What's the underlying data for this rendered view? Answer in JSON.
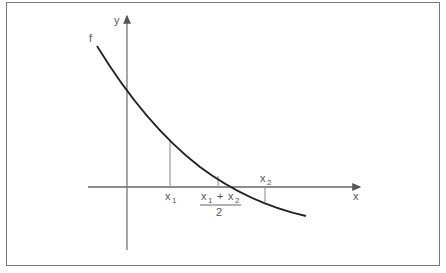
{
  "diagram": {
    "function_label": "f",
    "y_axis_label": "y",
    "x_axis_label": "x",
    "markers": [
      {
        "label": "x",
        "subscript": "1"
      },
      {
        "label": "x",
        "subscript": "2"
      }
    ],
    "midpoint": {
      "numerator_left": "x",
      "numerator_left_sub": "1",
      "operator": "+",
      "numerator_right": "x",
      "numerator_right_sub": "2",
      "denominator": "2"
    },
    "colors": {
      "curve": "#222222",
      "axes": "#666666",
      "guides": "#999999",
      "frame": "#7a7a7a"
    }
  }
}
